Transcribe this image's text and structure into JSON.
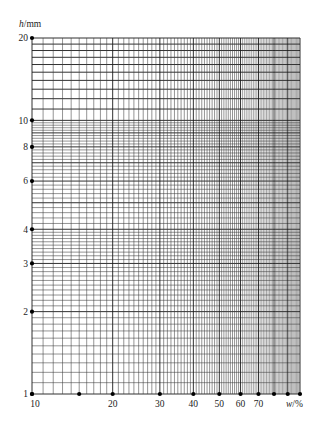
{
  "chart_data": {
    "type": "line",
    "title": "",
    "subtitle": "",
    "xlabel": {
      "var": "w",
      "unit": "/%"
    },
    "ylabel": {
      "var": "h",
      "unit": "/mm"
    },
    "xscale": "log",
    "yscale": "log",
    "xlim": [
      10,
      100
    ],
    "ylim": [
      1,
      20
    ],
    "x_tick_labels": [
      "10",
      "20",
      "30",
      "40",
      "50",
      "60",
      "70"
    ],
    "x_tick_label_values": [
      10,
      20,
      30,
      40,
      50,
      60,
      70
    ],
    "x_marker_values": [
      10,
      15,
      20,
      30,
      40,
      50,
      60,
      70,
      80,
      90,
      100
    ],
    "x_gridline_step": 1,
    "y_tick_labels": [
      "1",
      "2",
      "3",
      "4",
      "6",
      "8",
      "10",
      "20"
    ],
    "y_tick_label_values": [
      1,
      2,
      3,
      4,
      6,
      8,
      10,
      20
    ],
    "y_gridlines": [
      {
        "from": 1,
        "to": 4,
        "step": 0.1
      },
      {
        "from": 4,
        "to": 10,
        "step": 0.2
      },
      {
        "from": 10,
        "to": 20,
        "step": 1
      }
    ],
    "grid": true,
    "legend": null,
    "series": []
  },
  "labels": {
    "y_axis_var": "h",
    "y_axis_unit": "/mm",
    "x_axis_var": "w",
    "x_axis_unit": "/%"
  },
  "colors": {
    "grid_major": "#1a1a1a",
    "grid_minor": "#3a3a3a",
    "marker": "#000000",
    "text": "#222222"
  }
}
